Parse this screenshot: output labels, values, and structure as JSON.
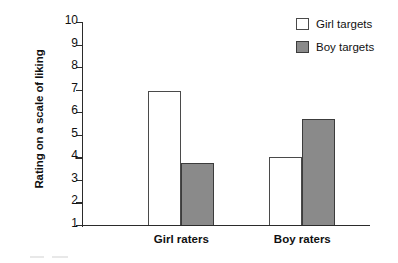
{
  "chart_data": {
    "type": "bar",
    "title": "",
    "subtitle": "",
    "xlabel": "",
    "ylabel": "Rating on a scale of liking",
    "categories": [
      "Girl raters",
      "Boy raters"
    ],
    "series": [
      {
        "name": "Girl targets",
        "values": [
          6.95,
          4.0
        ],
        "color": "#ffffff"
      },
      {
        "name": "Boy targets",
        "values": [
          3.75,
          5.7
        ],
        "color": "#8a8a8a"
      }
    ],
    "ylim": [
      1,
      10
    ],
    "ytick_labels": [
      "1",
      "2",
      "3",
      "4",
      "5",
      "6",
      "7",
      "8",
      "9",
      "10"
    ],
    "ytick_values": [
      1,
      2,
      3,
      4,
      5,
      6,
      7,
      8,
      9,
      10
    ],
    "grid": false,
    "legend_position": "top-right",
    "legend_entries": [
      "Girl targets",
      "Boy targets"
    ],
    "annotations": []
  },
  "axis": {
    "y_title": "Rating on a scale of liking",
    "line_color": "#2b2b2b"
  },
  "legend": {
    "items": [
      {
        "label": "Girl targets",
        "swatch": "light"
      },
      {
        "label": "Boy targets",
        "swatch": "dark"
      }
    ]
  },
  "colors": {
    "bar_light_fill": "#ffffff",
    "bar_light_stroke": "#4a4a4a",
    "bar_dark_fill": "#8a8a8a",
    "bar_dark_stroke": "#3c3c3c",
    "axis": "#2b2b2b",
    "text": "#111111",
    "background": "#ffffff"
  }
}
